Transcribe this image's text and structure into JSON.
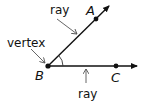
{
  "diagram": {
    "labels": {
      "ray_top": "ray",
      "ray_bottom": "ray",
      "vertex": "vertex"
    },
    "points": {
      "A": "A",
      "B": "B",
      "C": "C"
    },
    "colors": {
      "line": "#111111",
      "pointer": "#555555"
    }
  }
}
